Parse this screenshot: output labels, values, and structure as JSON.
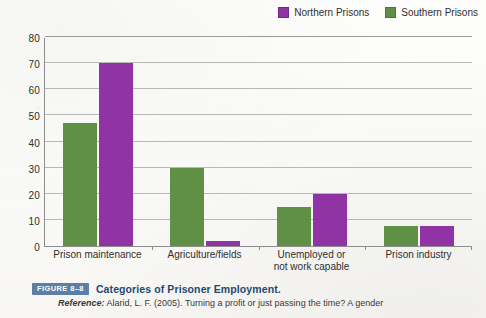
{
  "legend": {
    "position": "top-right",
    "items": [
      {
        "label": "Northern Prisons",
        "color": "#8f33a5",
        "icon": "legend-swatch-icon"
      },
      {
        "label": "Southern Prisons",
        "color": "#5f9045",
        "icon": "legend-swatch-icon"
      }
    ]
  },
  "caption": {
    "figure_badge": "FIGURE 8–8",
    "title": "Categories of Prisoner Employment.",
    "reference_label": "Reference:",
    "reference_text": " Alarid, L. F. (2005). Turning a profit or just passing the time? A gender"
  },
  "chart_data": {
    "type": "bar",
    "title": "Categories of Prisoner Employment.",
    "xlabel": "",
    "ylabel": "",
    "ylim": [
      0,
      80
    ],
    "yticks": [
      0,
      10,
      20,
      30,
      40,
      50,
      60,
      70,
      80
    ],
    "grid": true,
    "legend_position": "top-right",
    "categories": [
      "Prison maintenance",
      "Agriculture/fields",
      "Unemployed or\nnot work capable",
      "Prison industry"
    ],
    "category_lines": [
      [
        "Prison maintenance"
      ],
      [
        "Agriculture/fields"
      ],
      [
        "Unemployed or",
        "not work capable"
      ],
      [
        "Prison industry"
      ]
    ],
    "series": [
      {
        "name": "Southern Prisons",
        "color": "#5f9045",
        "values": [
          47,
          30,
          15,
          7.5
        ]
      },
      {
        "name": "Northern Prisons",
        "color": "#8f33a5",
        "values": [
          70,
          2,
          20,
          7.5
        ]
      }
    ]
  }
}
